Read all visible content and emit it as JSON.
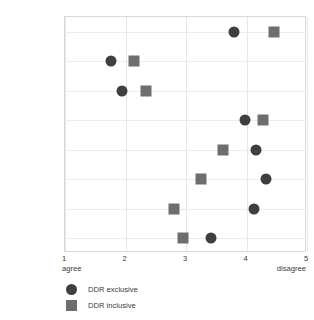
{
  "chart_data": {
    "type": "scatter",
    "title": "",
    "subtitle": "",
    "xlabel": "",
    "ylabel": "",
    "xlim": [
      1,
      5
    ],
    "xticks": [
      "1",
      "2",
      "3",
      "4",
      "5"
    ],
    "x_axis_low_label": "agree",
    "x_axis_high_label": "disagree",
    "grid": true,
    "legend_position": "below-left",
    "categories": [
      "Beneficial",
      "Free to take",
      "Using is\nnormal",
      "Cannabis\nlegalized",
      "Best is to stop",
      "Use leads to\naddiction",
      "Morally wrong",
      "Use is misuse"
    ],
    "series": [
      {
        "name": "DDR exclusive",
        "marker": "circle",
        "color": "#3f3f3f",
        "values": [
          3.8,
          1.76,
          1.94,
          3.98,
          4.16,
          4.32,
          4.12,
          3.41
        ]
      },
      {
        "name": "DDR inclusive",
        "marker": "square",
        "color": "#6e6e6e",
        "values": [
          4.46,
          2.14,
          2.34,
          4.27,
          3.61,
          3.25,
          2.8,
          2.95
        ]
      }
    ]
  }
}
